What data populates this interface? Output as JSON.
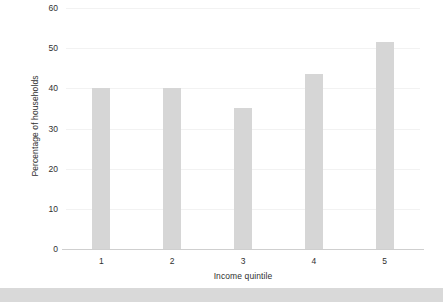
{
  "chart_data": {
    "type": "bar",
    "title": "",
    "xlabel": "Income quintile",
    "ylabel": "Percentage of households",
    "categories": [
      "1",
      "2",
      "3",
      "4",
      "5"
    ],
    "values": [
      40,
      40,
      35,
      43.5,
      51.5
    ],
    "ylim": [
      0,
      60
    ],
    "yticks": [
      0,
      10,
      20,
      30,
      40,
      50,
      60
    ],
    "ytick_labels": [
      "0",
      "10",
      "20",
      "30",
      "40",
      "50",
      "60"
    ],
    "grid": true,
    "legend": false,
    "bar_color": "#d6d6d6",
    "gridline_color": "#f2f2f2",
    "axis_color": "#cfcfcf",
    "background_color": "#ffffff"
  },
  "figure": {
    "bottom_band_color": "#d9d9d9"
  }
}
